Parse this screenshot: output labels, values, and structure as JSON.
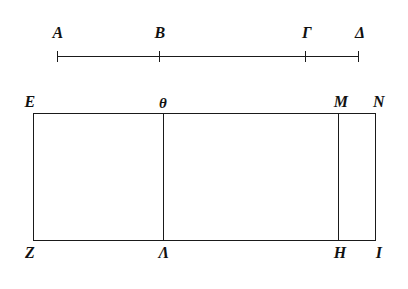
{
  "figure": {
    "background_color": "#ffffff",
    "ink_color": "#1a1a1a",
    "width": 408,
    "height": 289
  },
  "segment": {
    "name": "divided-line-segment",
    "baseline_y": 56,
    "start_x": 57,
    "end_x": 358,
    "points": [
      {
        "label": "A",
        "x": 57,
        "label_x": 58,
        "label_y": 25
      },
      {
        "label": "B",
        "x": 159,
        "label_x": 160,
        "label_y": 25
      },
      {
        "label": "Γ",
        "x": 305,
        "label_x": 307,
        "label_y": 25
      },
      {
        "label": "Δ",
        "x": 358,
        "label_x": 359,
        "label_y": 25
      }
    ]
  },
  "rectangle": {
    "name": "partitioned-rectangle",
    "left_x": 33,
    "right_x": 375,
    "top_y": 113,
    "bottom_y": 240,
    "interior_verticals": [
      {
        "name": "theta-lambda-divider",
        "x": 163
      },
      {
        "name": "m-h-divider",
        "x": 338
      }
    ],
    "top_labels": [
      {
        "label": "E",
        "x": 33,
        "label_x": 30,
        "label_y": 94
      },
      {
        "label": "θ",
        "x": 163,
        "label_x": 163,
        "label_y": 95
      },
      {
        "label": "M",
        "x": 338,
        "label_x": 340,
        "label_y": 94
      },
      {
        "label": "N",
        "x": 375,
        "label_x": 377,
        "label_y": 94
      }
    ],
    "bottom_labels": [
      {
        "label": "Z",
        "x": 33,
        "label_x": 30,
        "label_y": 245
      },
      {
        "label": "Λ",
        "x": 163,
        "label_x": 164,
        "label_y": 245
      },
      {
        "label": "H",
        "x": 338,
        "label_x": 339,
        "label_y": 245
      },
      {
        "label": "I",
        "x": 375,
        "label_x": 378,
        "label_y": 245
      }
    ]
  }
}
